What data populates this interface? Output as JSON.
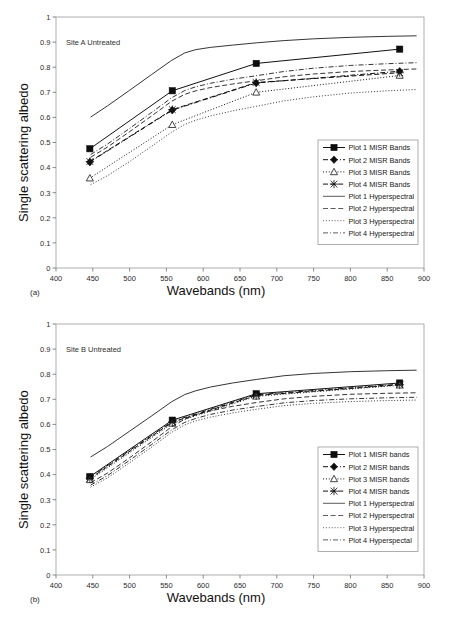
{
  "figure": {
    "panels": [
      {
        "tag": "(a)",
        "annotation": "Site A Untreated",
        "legend_position": "right-middle"
      },
      {
        "tag": "(b)",
        "annotation": "Site B Untreated",
        "legend_position": "right-middle"
      }
    ]
  },
  "chart_data": [
    {
      "type": "line",
      "title": "Site A Untreated",
      "panel": "(a)",
      "xlabel": "Wavebands (nm)",
      "ylabel": "Single scattering albedo",
      "xlim": [
        400,
        900
      ],
      "ylim": [
        0,
        1
      ],
      "xticks": [
        400,
        450,
        500,
        550,
        600,
        650,
        700,
        750,
        800,
        850,
        900
      ],
      "yticks": [
        0,
        0.1,
        0.2,
        0.3,
        0.4,
        0.5,
        0.6,
        0.7,
        0.8,
        0.9,
        1
      ],
      "grid": false,
      "legend": [
        "Plot 1 MISR Bands",
        "Plot 2 MISR Bands",
        "Plot 3 MISR Bands",
        "Plot 4 MISR Bands",
        "Plot 1 Hyperspectral",
        "Plot 2 Hyperspectral",
        "Plot 3 Hyperspectral",
        "Plot 4 Hyperspectral"
      ],
      "misr_wavebands": [
        446,
        558,
        672,
        867
      ],
      "series": [
        {
          "name": "Plot 1 MISR Bands",
          "kind": "misr",
          "marker": "filled-square",
          "dash": "solid",
          "x": [
            446,
            558,
            672,
            867
          ],
          "values": [
            0.475,
            0.706,
            0.815,
            0.872
          ]
        },
        {
          "name": "Plot 2 MISR Bands",
          "kind": "misr",
          "marker": "filled-diamond",
          "dash": "dashdot",
          "x": [
            446,
            558,
            672,
            867
          ],
          "values": [
            0.422,
            0.629,
            0.737,
            0.784
          ]
        },
        {
          "name": "Plot 3 MISR Bands",
          "kind": "misr",
          "marker": "open-triangle",
          "dash": "dotted",
          "x": [
            446,
            558,
            672,
            867
          ],
          "values": [
            0.358,
            0.571,
            0.7,
            0.767
          ]
        },
        {
          "name": "Plot 4 MISR Bands",
          "kind": "misr",
          "marker": "cross-star",
          "dash": "dashed",
          "x": [
            446,
            558,
            672,
            867
          ],
          "values": [
            0.424,
            0.631,
            0.739,
            0.778
          ]
        },
        {
          "name": "Plot 1 Hyperspectral",
          "kind": "hyperspectral",
          "marker": "none",
          "dash": "solid",
          "x": [
            447,
            470,
            500,
            530,
            557,
            575,
            590,
            610,
            640,
            672,
            710,
            750,
            800,
            850,
            890
          ],
          "values": [
            0.601,
            0.646,
            0.708,
            0.771,
            0.827,
            0.857,
            0.87,
            0.879,
            0.888,
            0.897,
            0.906,
            0.913,
            0.919,
            0.923,
            0.925
          ]
        },
        {
          "name": "Plot 2 Hyperspectral",
          "kind": "hyperspectral",
          "marker": "none",
          "dash": "dashed",
          "x": [
            447,
            470,
            500,
            530,
            557,
            575,
            590,
            610,
            640,
            672,
            710,
            750,
            800,
            850,
            890
          ],
          "values": [
            0.441,
            0.482,
            0.543,
            0.606,
            0.664,
            0.692,
            0.706,
            0.719,
            0.733,
            0.746,
            0.762,
            0.773,
            0.783,
            0.789,
            0.793
          ]
        },
        {
          "name": "Plot 3 Hyperspectral",
          "kind": "hyperspectral",
          "marker": "none",
          "dash": "dotted",
          "x": [
            447,
            470,
            500,
            530,
            557,
            575,
            590,
            610,
            640,
            672,
            710,
            750,
            800,
            850,
            890
          ],
          "values": [
            0.332,
            0.368,
            0.424,
            0.485,
            0.541,
            0.572,
            0.589,
            0.606,
            0.626,
            0.644,
            0.666,
            0.682,
            0.697,
            0.706,
            0.711
          ]
        },
        {
          "name": "Plot 4 Hyperspectral",
          "kind": "hyperspectral",
          "marker": "none",
          "dash": "dashdot",
          "x": [
            447,
            470,
            500,
            530,
            557,
            575,
            590,
            610,
            640,
            672,
            710,
            750,
            800,
            850,
            890
          ],
          "values": [
            0.452,
            0.494,
            0.556,
            0.62,
            0.678,
            0.707,
            0.722,
            0.736,
            0.752,
            0.766,
            0.783,
            0.796,
            0.807,
            0.814,
            0.818
          ]
        }
      ]
    },
    {
      "type": "line",
      "title": "Site B Untreated",
      "panel": "(b)",
      "xlabel": "Wavebands (nm)",
      "ylabel": "Single scattering albedo",
      "xlim": [
        400,
        900
      ],
      "ylim": [
        0,
        1
      ],
      "xticks": [
        400,
        450,
        500,
        550,
        600,
        650,
        700,
        750,
        800,
        850,
        900
      ],
      "yticks": [
        0,
        0.1,
        0.2,
        0.3,
        0.4,
        0.5,
        0.6,
        0.7,
        0.8,
        0.9,
        1
      ],
      "grid": false,
      "legend": [
        "Plot 1 MISR bands",
        "Plot 2 MISR bands",
        "Plot 3 MISR bands",
        "Plot 4 MISR bands",
        "Plot 1 Hyperspectral",
        "Plot 2 Hyperspectral",
        "Plot 3 Hyperspectral",
        "Plot 4 Hyperspectal"
      ],
      "misr_wavebands": [
        446,
        558,
        672,
        867
      ],
      "series": [
        {
          "name": "Plot 1 MISR bands",
          "kind": "misr",
          "marker": "filled-square",
          "dash": "solid",
          "x": [
            446,
            558,
            672,
            867
          ],
          "values": [
            0.392,
            0.617,
            0.722,
            0.765
          ]
        },
        {
          "name": "Plot 2 MISR bands",
          "kind": "misr",
          "marker": "filled-diamond",
          "dash": "dashdot",
          "x": [
            446,
            558,
            672,
            867
          ],
          "values": [
            0.388,
            0.612,
            0.718,
            0.76
          ]
        },
        {
          "name": "Plot 3 MISR bands",
          "kind": "misr",
          "marker": "open-triangle",
          "dash": "dotted",
          "x": [
            446,
            558,
            672,
            867
          ],
          "values": [
            0.379,
            0.604,
            0.712,
            0.756
          ]
        },
        {
          "name": "Plot 4 MISR bands",
          "kind": "misr",
          "marker": "cross-star",
          "dash": "dashed",
          "x": [
            446,
            558,
            672,
            867
          ],
          "values": [
            0.384,
            0.609,
            0.715,
            0.758
          ]
        },
        {
          "name": "Plot 1 Hyperspectral",
          "kind": "hyperspectral",
          "marker": "none",
          "dash": "solid",
          "x": [
            447,
            470,
            500,
            530,
            557,
            575,
            590,
            610,
            640,
            672,
            710,
            750,
            800,
            850,
            890
          ],
          "values": [
            0.47,
            0.512,
            0.573,
            0.634,
            0.69,
            0.719,
            0.734,
            0.749,
            0.765,
            0.779,
            0.794,
            0.803,
            0.81,
            0.814,
            0.816
          ]
        },
        {
          "name": "Plot 2 Hyperspectral",
          "kind": "hyperspectral",
          "marker": "none",
          "dash": "dashed",
          "x": [
            447,
            470,
            500,
            530,
            557,
            575,
            590,
            610,
            640,
            672,
            710,
            750,
            800,
            850,
            890
          ],
          "values": [
            0.368,
            0.406,
            0.467,
            0.531,
            0.59,
            0.621,
            0.638,
            0.654,
            0.672,
            0.687,
            0.702,
            0.712,
            0.72,
            0.724,
            0.726
          ]
        },
        {
          "name": "Plot 3 Hyperspectral",
          "kind": "hyperspectral",
          "marker": "none",
          "dash": "dotted",
          "x": [
            447,
            470,
            500,
            530,
            557,
            575,
            590,
            610,
            640,
            672,
            710,
            750,
            800,
            850,
            890
          ],
          "values": [
            0.35,
            0.387,
            0.447,
            0.51,
            0.568,
            0.598,
            0.614,
            0.629,
            0.646,
            0.66,
            0.675,
            0.684,
            0.691,
            0.695,
            0.697
          ]
        },
        {
          "name": "Plot 4 Hyperspectal",
          "kind": "hyperspectral",
          "marker": "none",
          "dash": "dashdot",
          "x": [
            447,
            470,
            500,
            530,
            557,
            575,
            590,
            610,
            640,
            672,
            710,
            750,
            800,
            850,
            890
          ],
          "values": [
            0.358,
            0.396,
            0.457,
            0.52,
            0.578,
            0.608,
            0.624,
            0.64,
            0.657,
            0.671,
            0.686,
            0.695,
            0.702,
            0.706,
            0.708
          ]
        }
      ]
    }
  ]
}
